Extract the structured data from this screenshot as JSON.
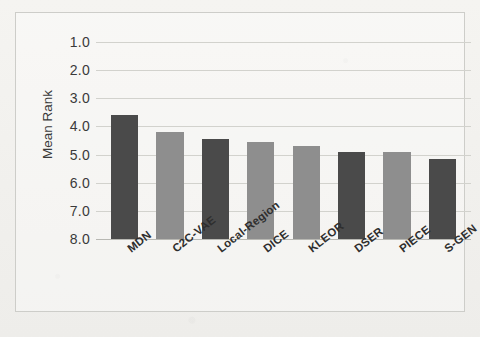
{
  "chart_data": {
    "type": "bar",
    "title": "",
    "xlabel": "",
    "ylabel": "Mean Rank",
    "categories": [
      "MDN",
      "C2C-VAE",
      "Local-Region",
      "DICE",
      "KLEOR",
      "DSER",
      "PIECE",
      "S-GEN"
    ],
    "values": [
      3.6,
      4.2,
      4.45,
      4.55,
      4.7,
      4.9,
      4.9,
      5.15
    ],
    "ylim": [
      1.0,
      8.0
    ],
    "y_inverted": true,
    "yticks": [
      "1.0",
      "2.0",
      "3.0",
      "4.0",
      "5.0",
      "6.0",
      "7.0",
      "8.0"
    ],
    "ytick_values": [
      1.0,
      2.0,
      3.0,
      4.0,
      5.0,
      6.0,
      7.0,
      8.0
    ],
    "grid": true,
    "legend": "none",
    "bar_colors": [
      "#4a4a4a",
      "#8e8e8e",
      "#4a4a4a",
      "#8e8e8e",
      "#8e8e8e",
      "#4a4a4a",
      "#8e8e8e",
      "#4a4a4a"
    ],
    "series": [
      {
        "name": "Mean Rank",
        "values": [
          3.6,
          4.2,
          4.45,
          4.55,
          4.7,
          4.9,
          4.9,
          5.15
        ]
      }
    ]
  },
  "figure": {
    "partial_title_top": "",
    "background_color": "#f3f2ef",
    "frame_color": "#cdcdc9",
    "gridline_color": "#d2d2cd",
    "text_color": "#2e2e2e"
  }
}
